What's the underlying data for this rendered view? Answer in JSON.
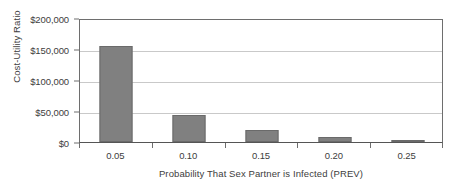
{
  "chart_data": {
    "type": "bar",
    "title": "",
    "xlabel": "Probability That Sex Partner is Infected (PREV)",
    "ylabel": "Cost-Utility Ratio",
    "categories": [
      "0.05",
      "0.10",
      "0.15",
      "0.20",
      "0.25"
    ],
    "values": [
      155000,
      44000,
      20000,
      8500,
      2500
    ],
    "ylim": [
      0,
      200000
    ],
    "ytick_values": [
      0,
      50000,
      100000,
      150000,
      200000
    ],
    "ytick_labels": [
      "$0",
      "$50,000",
      "$100,000",
      "$150,000",
      "$200,000"
    ],
    "grid": true,
    "legend": false,
    "legend_position": "none",
    "bar_color": "#808080",
    "bar_border_color": "#6a6a6a",
    "gridline_color": "#c9c9c9",
    "axis_color": "#6e6e6e",
    "text_color": "#3d3d3d",
    "background_color": "#ffffff"
  }
}
